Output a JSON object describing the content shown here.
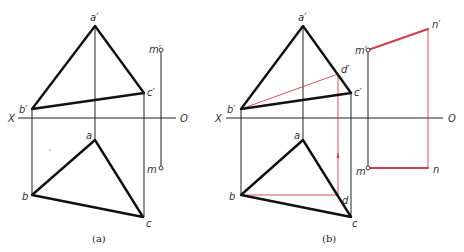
{
  "figures": [
    {
      "id": "a",
      "caption": "(a)",
      "axis": {
        "left_label": "X",
        "right_label": "O"
      },
      "labels": {
        "a_prime": "a′",
        "b_prime": "b′",
        "c_prime": "c′",
        "m_prime": "m′",
        "a": "a",
        "b": "b",
        "c": "c",
        "m": "m"
      }
    },
    {
      "id": "b",
      "caption": "(b)",
      "axis": {
        "left_label": "X",
        "right_label": "O"
      },
      "labels": {
        "a_prime": "a′",
        "b_prime": "b′",
        "c_prime": "c′",
        "d_prime": "d′",
        "m_prime": "m′",
        "n_prime": "n′",
        "a": "a",
        "b": "b",
        "c": "c",
        "d": "d",
        "m": "m",
        "n": "n"
      }
    }
  ],
  "colors": {
    "outline": "#111111",
    "construction": "#d0404a"
  }
}
